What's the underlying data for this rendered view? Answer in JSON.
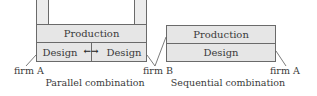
{
  "parallel": {
    "top_block": "Production",
    "left_block": "Design",
    "right_block": "Design",
    "arrow": "←→",
    "firm_left": "firm A",
    "firm_right": "firm B",
    "caption": "Parallel combination"
  },
  "sequential": {
    "top_block": "Production",
    "bottom_block": "Design",
    "firm_left": "firm B",
    "firm_right": "firm A",
    "caption": "Sequential combination"
  },
  "colors": {
    "block_fill": "#e6e6e6",
    "stroke": "#6a6a6a",
    "text": "#3a3a3a"
  }
}
